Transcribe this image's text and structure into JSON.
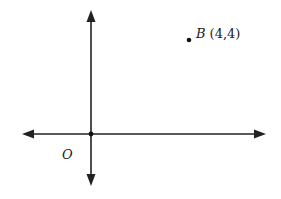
{
  "diagram": {
    "type": "coordinate-plane",
    "origin_label": "O",
    "point": {
      "name": "B",
      "coords_label": "(4,4)",
      "x": 4,
      "y": 4
    },
    "colors": {
      "axis": "#222222",
      "background": "#ffffff"
    }
  }
}
